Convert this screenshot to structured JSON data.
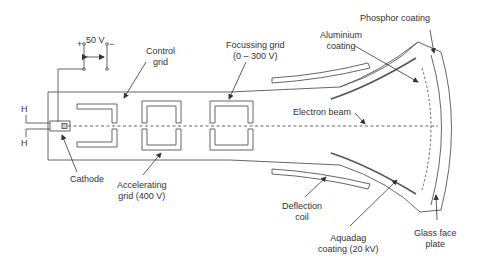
{
  "diagram": {
    "labels": {
      "voltage": "50 V",
      "plus": "+",
      "minus": "−",
      "control_grid_1": "Control",
      "control_grid_2": "grid",
      "focussing_grid_1": "Focussing grid",
      "focussing_grid_2": "(0 – 300 V)",
      "aluminium_1": "Aluminium",
      "aluminium_2": "coating",
      "phosphor": "Phosphor coating",
      "electron_beam": "Electron beam",
      "heater_top": "H",
      "heater_bottom": "H",
      "cathode": "Cathode",
      "accelerating_1": "Accelerating",
      "accelerating_2": "grid (400 V)",
      "deflection_1": "Deflection",
      "deflection_2": "coil",
      "aquadag_1": "Aquadag",
      "aquadag_2": "coating (20 kV)",
      "glass_1": "Glass face",
      "glass_2": "plate"
    },
    "colors": {
      "line": "#4a4a4a",
      "text": "#333333",
      "background": "#ffffff"
    }
  }
}
